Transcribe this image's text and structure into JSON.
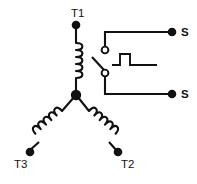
{
  "diagram": {
    "name": "wye-winding-with-centrifugal-switch",
    "background_color": "#ffffff",
    "line_color": "#111111",
    "width": 197,
    "height": 184
  },
  "terminals": {
    "t1": {
      "label": "T1",
      "x": 76,
      "y": 25,
      "label_x": 71,
      "label_y": 17
    },
    "t2": {
      "label": "T2",
      "x": 118,
      "y": 152,
      "label_x": 121,
      "label_y": 168
    },
    "t3": {
      "label": "T3",
      "x": 30,
      "y": 152,
      "label_x": 14,
      "label_y": 168
    },
    "s_top": {
      "label": "S",
      "x": 172,
      "y": 32,
      "label_x": 181,
      "label_y": 36
    },
    "s_bottom": {
      "label": "S",
      "x": 172,
      "y": 94,
      "label_x": 181,
      "label_y": 98
    }
  },
  "junction": {
    "name": "wye-center-node",
    "x": 76,
    "y": 95
  },
  "windings": [
    {
      "name": "winding-t1",
      "from": "t1",
      "to": "wye-center-node",
      "turns": 5
    },
    {
      "name": "winding-t2",
      "from": "wye-center-node",
      "to": "t2",
      "turns": 5
    },
    {
      "name": "winding-t3",
      "from": "wye-center-node",
      "to": "t3",
      "turns": 5
    }
  ],
  "switch": {
    "name": "centrifugal-switch",
    "type": "normally-closed-contacts",
    "top_contact": {
      "x": 105,
      "y": 50,
      "radius": 3.4
    },
    "bottom_contact": {
      "x": 105,
      "y": 73,
      "radius": 3.4
    },
    "blade": {
      "x1": 93,
      "y1": 58,
      "x2": 104,
      "y2": 70
    },
    "cam_pulse": {
      "baseline_y": 65,
      "top_y": 54,
      "start_x": 112,
      "rise_x": 120,
      "fall_x": 130,
      "end_x": 157
    },
    "top_lead": {
      "from_x": 105,
      "from_y": 46,
      "corner_x": 105,
      "corner_y": 32,
      "to_x": 170,
      "to_y": 32
    },
    "bottom_lead": {
      "from_x": 105,
      "from_y": 77,
      "corner_x": 105,
      "corner_y": 94,
      "to_x": 170,
      "to_y": 94
    }
  }
}
